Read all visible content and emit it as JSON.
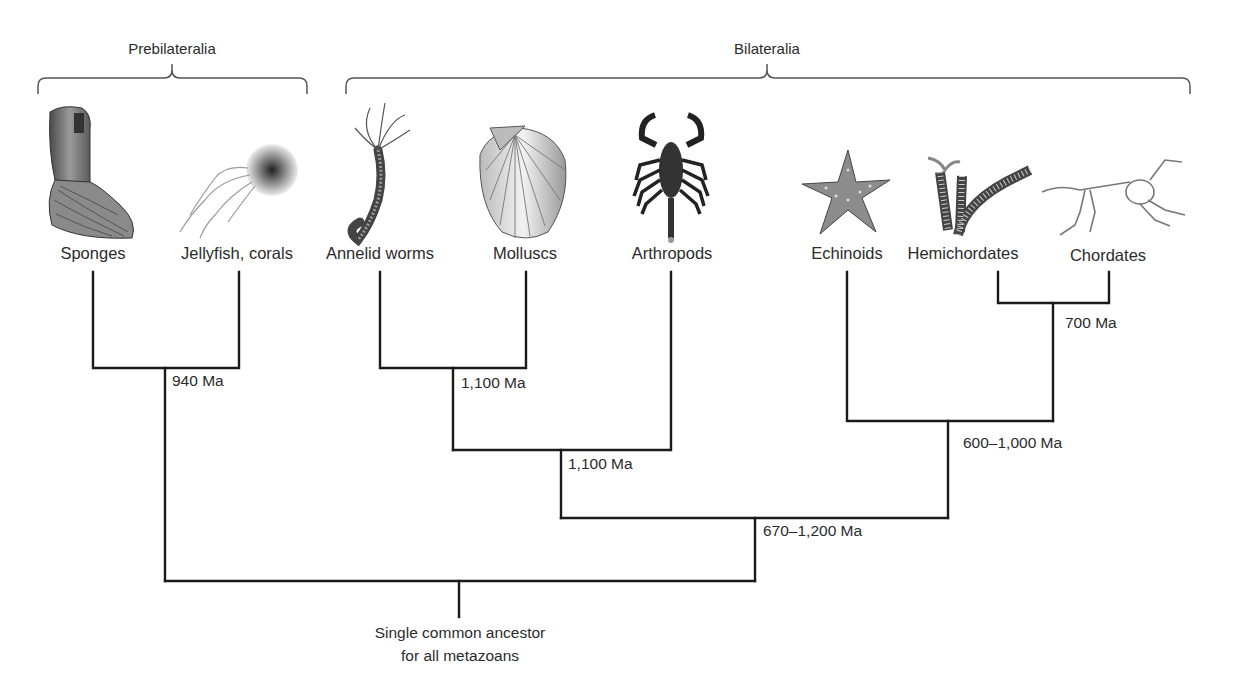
{
  "groups": [
    {
      "name": "Prebilateralia",
      "x": 172,
      "bracket": [
        38,
        307
      ]
    },
    {
      "name": "Bilateralia",
      "x": 767,
      "bracket": [
        346,
        1190
      ]
    }
  ],
  "taxa": [
    {
      "name": "Sponges",
      "x": 93,
      "icon": "sponge-icon"
    },
    {
      "name": "Jellyfish, corals",
      "x": 239,
      "icon": "jellyfish-icon"
    },
    {
      "name": "Annelid worms",
      "x": 380,
      "icon": "worm-icon"
    },
    {
      "name": "Molluscs",
      "x": 526,
      "icon": "shell-icon"
    },
    {
      "name": "Arthropods",
      "x": 671,
      "icon": "scorpion-icon"
    },
    {
      "name": "Echinoids",
      "x": 847,
      "icon": "starfish-icon"
    },
    {
      "name": "Hemichordates",
      "x": 963,
      "icon": "acorn-worm-icon"
    },
    {
      "name": "Chordates",
      "x": 1108,
      "icon": "skeleton-icon"
    }
  ],
  "divergences": [
    {
      "label": "940 Ma",
      "x": 172,
      "y": 372
    },
    {
      "label": "1,100 Ma",
      "x": 461,
      "y": 374
    },
    {
      "label": "1,100 Ma",
      "x": 568,
      "y": 455
    },
    {
      "label": "700 Ma",
      "x": 1065,
      "y": 314
    },
    {
      "label": "600–1,000 Ma",
      "x": 963,
      "y": 434
    },
    {
      "label": "670–1,200 Ma",
      "x": 763,
      "y": 522
    }
  ],
  "root": {
    "line1": "Single common ancestor",
    "line2": "for all metazoans"
  },
  "colors": {
    "line": "#1a1a1a",
    "bracket": "#555555",
    "text": "#2b2b2b"
  }
}
